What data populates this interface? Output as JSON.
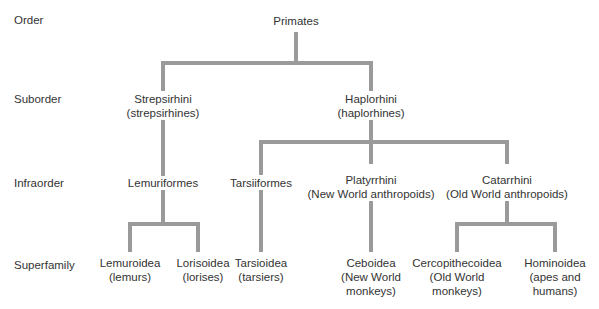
{
  "ranks": {
    "order": "Order",
    "suborder": "Suborder",
    "infraorder": "Infraorder",
    "superfamily": "Superfamily"
  },
  "nodes": {
    "primates": {
      "name": "Primates"
    },
    "strepsirhini": {
      "name": "Strepsirhini",
      "common": "(strepsirhines)"
    },
    "haplorhini": {
      "name": "Haplorhini",
      "common": "(haplorhines)"
    },
    "lemuriformes": {
      "name": "Lemuriformes"
    },
    "tarsiiformes": {
      "name": "Tarsiiformes"
    },
    "platyrrhini": {
      "name": "Platyrrhini",
      "common": "(New World anthropoids)"
    },
    "catarrhini": {
      "name": "Catarrhini",
      "common": "(Old World anthropoids)"
    },
    "lemuroidea": {
      "name": "Lemuroidea",
      "common": "(lemurs)"
    },
    "lorisoidea": {
      "name": "Lorisoidea",
      "common": "(lorises)"
    },
    "tarsioidea": {
      "name": "Tarsioidea",
      "common": "(tarsiers)"
    },
    "ceboidea": {
      "name": "Ceboidea",
      "common1": "(New World",
      "common2": "monkeys)"
    },
    "cercopithecoidea": {
      "name": "Cercopithecoidea",
      "common1": "(Old World",
      "common2": "monkeys)"
    },
    "hominoidea": {
      "name": "Hominoidea",
      "common1": "(apes and",
      "common2": "humans)"
    }
  },
  "colors": {
    "line": "#9a9a9a",
    "text": "#333333"
  }
}
